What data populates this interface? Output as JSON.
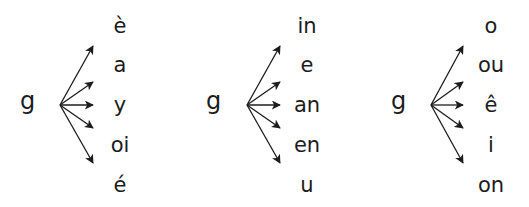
{
  "diagram": {
    "type": "syllable-combination",
    "groups": [
      {
        "consonant": "g",
        "endings": [
          "è",
          "a",
          "y",
          "oi",
          "é"
        ]
      },
      {
        "consonant": "g",
        "endings": [
          "in",
          "e",
          "an",
          "en",
          "u"
        ]
      },
      {
        "consonant": "g",
        "endings": [
          "o",
          "ou",
          "ê",
          "i",
          "on"
        ]
      }
    ],
    "colors": {
      "text": "#1c1c1c",
      "arrow": "#1c1c1c",
      "background": "#ffffff"
    }
  }
}
